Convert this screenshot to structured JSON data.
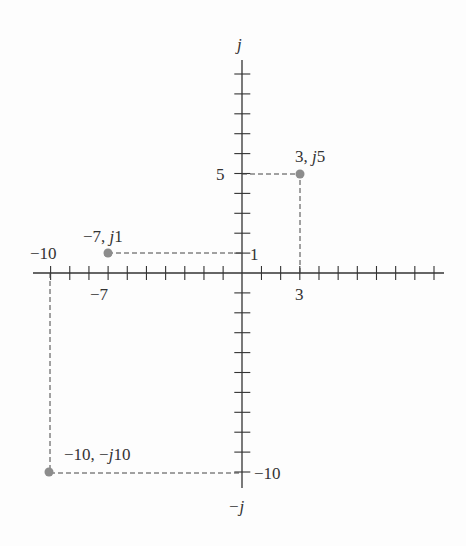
{
  "diagram": {
    "title": "",
    "axes": {
      "positive_imag_label": "j",
      "negative_imag_label": "−j",
      "x_range": [
        -10,
        10
      ],
      "y_range": [
        -10,
        10
      ],
      "tick_step": 1
    },
    "tick_labels": [
      {
        "text": "−10",
        "axis": "x",
        "value": -10
      },
      {
        "text": "−7",
        "axis": "x",
        "value": -7
      },
      {
        "text": "3",
        "axis": "x",
        "value": 3
      },
      {
        "text": "5",
        "axis": "y",
        "value": 5
      },
      {
        "text": "1",
        "axis": "y",
        "value": 1
      },
      {
        "text": "−10",
        "axis": "y",
        "value": -10
      }
    ],
    "points": [
      {
        "label": "3, j5",
        "label_pre": "3, ",
        "label_j": "j",
        "label_post": "5",
        "re": 3,
        "im": 5
      },
      {
        "label": "−7, j1",
        "label_pre": "−7, ",
        "label_j": "j",
        "label_post": "1",
        "re": -7,
        "im": 1
      },
      {
        "label": "−10, −j10",
        "label_pre": "−10, −",
        "label_j": "j",
        "label_post": "10",
        "re": -10,
        "im": -10
      }
    ],
    "colors": {
      "axis": "#333333",
      "point": "#8c8c8c",
      "text": "#333333"
    }
  }
}
